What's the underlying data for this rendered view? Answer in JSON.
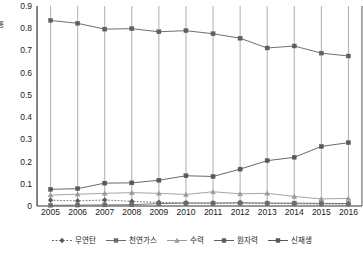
{
  "chart_data": {
    "type": "line",
    "title": "",
    "xlabel": "",
    "ylabel": "율",
    "ylim": [
      0,
      0.9
    ],
    "ytick_step": 0.1,
    "grid": "vertical-only",
    "legend_position": "bottom",
    "categories": [
      "2005",
      "2006",
      "2007",
      "2008",
      "2009",
      "2010",
      "2011",
      "2012",
      "2013",
      "2014",
      "2015",
      "2016"
    ],
    "yticks": [
      "0",
      "0.1",
      "0.2",
      "0.3",
      "0.4",
      "0.5",
      "0.6",
      "0.7",
      "0.8",
      "0.9"
    ],
    "series": [
      {
        "name": "무연탄",
        "marker": "diamond",
        "linestyle": "dotted",
        "color": "#5a5a5a",
        "values": [
          0.026,
          0.023,
          0.027,
          0.021,
          0.016,
          0.014,
          0.013,
          0.014,
          0.012,
          0.01,
          0.009,
          0.009
        ]
      },
      {
        "name": "천연가스",
        "marker": "square",
        "linestyle": "solid",
        "color": "#6b6b6b",
        "values": [
          0.003,
          0.004,
          0.005,
          0.006,
          0.011,
          0.013,
          0.013,
          0.014,
          0.013,
          0.013,
          0.012,
          0.011
        ]
      },
      {
        "name": "수력",
        "marker": "triangle",
        "linestyle": "solid",
        "color": "#9a9a9a",
        "values": [
          0.049,
          0.053,
          0.057,
          0.06,
          0.057,
          0.052,
          0.064,
          0.055,
          0.057,
          0.043,
          0.032,
          0.034
        ]
      },
      {
        "name": "원자력",
        "marker": "square",
        "linestyle": "solid",
        "color": "#5f5f5f",
        "values": [
          0.835,
          0.822,
          0.796,
          0.798,
          0.784,
          0.789,
          0.775,
          0.755,
          0.711,
          0.72,
          0.688,
          0.675
        ]
      },
      {
        "name": "신재생",
        "marker": "square",
        "linestyle": "solid",
        "color": "#585858",
        "values": [
          0.075,
          0.078,
          0.103,
          0.104,
          0.116,
          0.136,
          0.133,
          0.166,
          0.204,
          0.219,
          0.268,
          0.285
        ]
      }
    ]
  }
}
